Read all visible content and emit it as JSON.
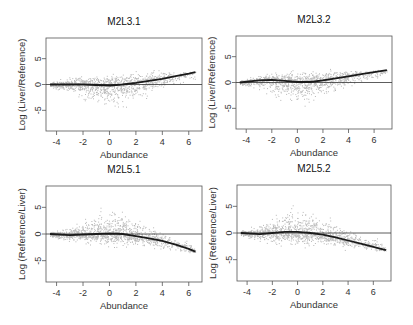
{
  "figure": {
    "layout": "2x2 grid of MA-style scatter plots",
    "colors": {
      "points": "#b8b8b8",
      "loess": "#1a1a1a",
      "zero_line": "#333333",
      "frame": "#555555",
      "text": "#333333"
    }
  },
  "chart_data": [
    {
      "type": "scatter",
      "title": "M2L3.1",
      "xlabel": "Abundance",
      "ylabel": "Log (Liver/Reference)",
      "xticks": [
        -4,
        -2,
        0,
        2,
        4,
        6
      ],
      "yticks": [
        5,
        0,
        -5
      ],
      "xlim": [
        -4.8,
        7.0
      ],
      "ylim": [
        -9,
        9
      ],
      "grid": false,
      "hline": 0,
      "box": {
        "left": 46,
        "top": 38,
        "right": 202,
        "bottom": 131
      },
      "cloud": {
        "x_range": [
          -4.5,
          6.5
        ],
        "upper_env": [
          [
            -4.5,
            0.6
          ],
          [
            -3,
            2.2
          ],
          [
            -1,
            2.6
          ],
          [
            1,
            3.0
          ],
          [
            2,
            3.2
          ],
          [
            4,
            3.0
          ],
          [
            6,
            2.6
          ]
        ],
        "lower_env": [
          [
            -4.5,
            -0.6
          ],
          [
            -3,
            -2.2
          ],
          [
            -1,
            -5.0
          ],
          [
            0,
            -5.5
          ],
          [
            1,
            -5.5
          ],
          [
            2,
            -4.5
          ],
          [
            4,
            -1.5
          ],
          [
            6,
            0.5
          ]
        ]
      },
      "series": [
        {
          "name": "loess fit",
          "x": [
            -4.5,
            -3,
            -2,
            -1,
            0,
            1,
            2,
            3,
            4,
            5,
            6,
            6.5
          ],
          "y": [
            0,
            0,
            0,
            -0.1,
            -0.2,
            0,
            0.3,
            0.7,
            1.1,
            1.6,
            2.1,
            2.4
          ]
        }
      ]
    },
    {
      "type": "scatter",
      "title": "M2L3.2",
      "xlabel": "Abundance",
      "ylabel": "Log (Liver/Reference)",
      "xticks": [
        -4,
        -2,
        0,
        2,
        4,
        6
      ],
      "yticks": [
        5,
        0,
        -5
      ],
      "xlim": [
        -4.8,
        7.4
      ],
      "ylim": [
        -9,
        9
      ],
      "grid": false,
      "hline": 0,
      "box": {
        "left": 236,
        "top": 36,
        "right": 392,
        "bottom": 129
      },
      "cloud": {
        "x_range": [
          -4.5,
          7.0
        ],
        "upper_env": [
          [
            -4.5,
            0.5
          ],
          [
            -3,
            2.0
          ],
          [
            -1,
            2.6
          ],
          [
            1,
            2.8
          ],
          [
            3,
            3.0
          ],
          [
            5,
            2.8
          ],
          [
            7,
            2.4
          ]
        ],
        "lower_env": [
          [
            -4.5,
            -0.5
          ],
          [
            -3,
            -2.0
          ],
          [
            -1,
            -4.5
          ],
          [
            0,
            -5.2
          ],
          [
            1,
            -4.8
          ],
          [
            3,
            -3.0
          ],
          [
            5,
            -0.5
          ],
          [
            7,
            0.5
          ]
        ]
      },
      "series": [
        {
          "name": "loess fit",
          "x": [
            -4.5,
            -3,
            -2,
            -1,
            0,
            1,
            2,
            3,
            4,
            5,
            6,
            7
          ],
          "y": [
            0,
            0.4,
            0.5,
            0.3,
            0.1,
            0.1,
            0.4,
            0.8,
            1.2,
            1.6,
            2.0,
            2.4
          ]
        }
      ]
    },
    {
      "type": "scatter",
      "title": "M2L5.1",
      "xlabel": "Abundance",
      "ylabel": "Log (Reference/Liver)",
      "xticks": [
        -4,
        -2,
        0,
        2,
        4,
        6
      ],
      "yticks": [
        5,
        0,
        -5
      ],
      "xlim": [
        -4.8,
        7.0
      ],
      "ylim": [
        -9,
        9
      ],
      "grid": false,
      "hline": 0,
      "box": {
        "left": 46,
        "top": 186,
        "right": 202,
        "bottom": 282
      },
      "cloud": {
        "x_range": [
          -4.5,
          6.5
        ],
        "upper_env": [
          [
            -4.5,
            0.6
          ],
          [
            -3,
            2.0
          ],
          [
            -1,
            5.0
          ],
          [
            0,
            6.0
          ],
          [
            1,
            5.5
          ],
          [
            2,
            4.0
          ],
          [
            4,
            1.0
          ],
          [
            6,
            -1.0
          ]
        ],
        "lower_env": [
          [
            -4.5,
            -0.6
          ],
          [
            -3,
            -1.8
          ],
          [
            -1,
            -2.5
          ],
          [
            1,
            -2.8
          ],
          [
            2,
            -3.0
          ],
          [
            4,
            -3.5
          ],
          [
            6,
            -4.0
          ]
        ]
      },
      "series": [
        {
          "name": "loess fit",
          "x": [
            -4.5,
            -3,
            -2,
            -1,
            0,
            1,
            2,
            3,
            4,
            5,
            6,
            6.5
          ],
          "y": [
            0,
            -0.2,
            -0.1,
            0,
            0.1,
            0,
            -0.4,
            -0.8,
            -1.3,
            -2.0,
            -2.8,
            -3.3
          ]
        }
      ]
    },
    {
      "type": "scatter",
      "title": "M2L5.2",
      "xlabel": "Abundance",
      "ylabel": "Log (Reference/Liver)",
      "xticks": [
        -4,
        -2,
        0,
        2,
        4,
        6
      ],
      "yticks": [
        5,
        0,
        -5
      ],
      "xlim": [
        -4.8,
        7.4
      ],
      "ylim": [
        -9,
        9
      ],
      "grid": false,
      "hline": 0,
      "box": {
        "left": 237,
        "top": 185,
        "right": 391,
        "bottom": 281
      },
      "cloud": {
        "x_range": [
          -4.5,
          7.0
        ],
        "upper_env": [
          [
            -4.5,
            0.6
          ],
          [
            -3,
            2.5
          ],
          [
            -1,
            5.5
          ],
          [
            0,
            6.0
          ],
          [
            1,
            5.0
          ],
          [
            3,
            3.0
          ],
          [
            5,
            0.5
          ],
          [
            7,
            -1.0
          ]
        ],
        "lower_env": [
          [
            -4.5,
            -0.6
          ],
          [
            -3,
            -2.0
          ],
          [
            -1,
            -3.0
          ],
          [
            1,
            -3.0
          ],
          [
            3,
            -3.2
          ],
          [
            5,
            -3.5
          ],
          [
            7,
            -3.8
          ]
        ]
      },
      "series": [
        {
          "name": "loess fit",
          "x": [
            -4.5,
            -3,
            -2,
            -1,
            0,
            1,
            2,
            3,
            4,
            5,
            6,
            7
          ],
          "y": [
            0,
            -0.2,
            0,
            0.2,
            0.2,
            0,
            -0.3,
            -0.8,
            -1.4,
            -2.0,
            -2.6,
            -3.2
          ]
        }
      ]
    }
  ]
}
